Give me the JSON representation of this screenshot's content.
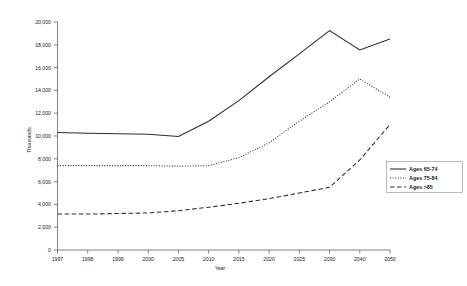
{
  "chart_data": {
    "type": "line",
    "title": "",
    "xlabel": "Year",
    "ylabel": "Thousands",
    "categories": [
      "1997",
      "1998",
      "1999",
      "2000",
      "2005",
      "2010",
      "2015",
      "2020",
      "2025",
      "2030",
      "2040",
      "2050"
    ],
    "ylim": [
      0,
      20000
    ],
    "ytick_values": [
      0,
      2000,
      4000,
      6000,
      8000,
      10000,
      12000,
      14000,
      16000,
      18000,
      20000
    ],
    "ytick_labels": [
      "0",
      "2,000",
      "4,000",
      "6,000",
      "8,000",
      "10,000",
      "12,000",
      "14,000",
      "16,000",
      "18,000",
      "20,000"
    ],
    "grid": false,
    "legend_position": "right-middle",
    "series": [
      {
        "name": "Ages 65-74",
        "style": "solid",
        "values": [
          10300,
          10250,
          10200,
          10150,
          9950,
          11300,
          13100,
          15200,
          17200,
          19250,
          17550,
          18500
        ]
      },
      {
        "name": "Ages 75-84",
        "style": "dotted",
        "values": [
          7400,
          7400,
          7400,
          7400,
          7350,
          7400,
          8100,
          9400,
          11300,
          13000,
          15000,
          13400
        ]
      },
      {
        "name": "Ages >85",
        "style": "dashed",
        "values": [
          3150,
          3150,
          3200,
          3250,
          3450,
          3750,
          4100,
          4500,
          5000,
          5500,
          7900,
          11000
        ]
      }
    ]
  },
  "axis": {
    "y_title": "Thousands",
    "x_title": "Year"
  },
  "legend": {
    "entries": [
      {
        "label": "Ages 65-74",
        "style": "solid"
      },
      {
        "label": "Ages 75-84",
        "style": "dotted"
      },
      {
        "label": "Ages >85",
        "style": "dashed"
      }
    ]
  }
}
